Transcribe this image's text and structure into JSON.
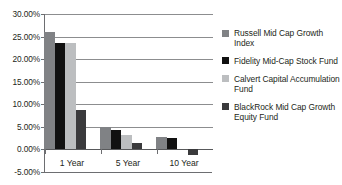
{
  "chart_data": {
    "type": "bar",
    "title": "",
    "xlabel": "",
    "ylabel": "",
    "categories": [
      "1 Year",
      "5 Year",
      "10 Year"
    ],
    "series": [
      {
        "name": "Russell Mid Cap Growth Index",
        "color": "#808285",
        "values": [
          26.0,
          4.9,
          2.8
        ]
      },
      {
        "name": "Fidelity Mid-Cap Stock Fund",
        "color": "#111111",
        "values": [
          23.5,
          4.3,
          2.55
        ]
      },
      {
        "name": "Calvert Capital Accumulation Fund",
        "color": "#bcbec0",
        "values": [
          23.6,
          3.1,
          0.0
        ]
      },
      {
        "name": "BlackRock Mid Cap Growth Equity Fund",
        "color": "#3a3a3c",
        "values": [
          8.7,
          1.5,
          -1.2
        ]
      }
    ],
    "ylim": [
      -5.0,
      30.0
    ],
    "ytick_values": [
      30.0,
      25.0,
      20.0,
      15.0,
      10.0,
      5.0,
      0.0,
      -5.0
    ],
    "ytick_labels": [
      "30.00%",
      "25.00%",
      "20.00%",
      "15.00%",
      "10.00%",
      "5.00%",
      "0.00%",
      "-5.00%"
    ],
    "grid": true,
    "legend_position": "right"
  },
  "legend": {
    "items": [
      {
        "label": "Russell Mid Cap Growth Index",
        "color": "#808285"
      },
      {
        "label": "Fidelity Mid-Cap Stock Fund",
        "color": "#111111"
      },
      {
        "label": "Calvert Capital Accumulation Fund",
        "color": "#bcbec0"
      },
      {
        "label": "BlackRock Mid Cap Growth Equity Fund",
        "color": "#3a3a3c"
      }
    ]
  }
}
